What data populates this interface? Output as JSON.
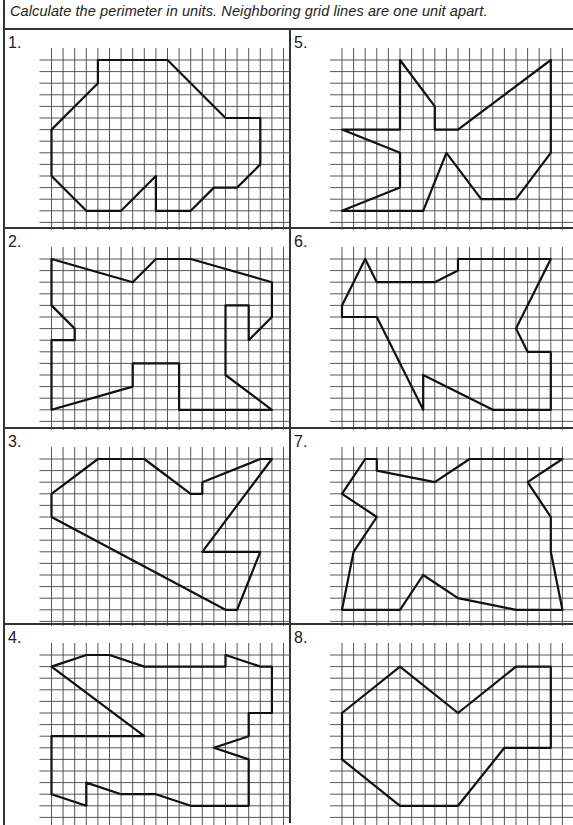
{
  "instructions": "Calculate the perimeter in units. Neighboring grid lines are one unit apart.",
  "grid": {
    "columns": 20,
    "rows": 14,
    "unit_px": 11.6,
    "line_color": "#444444",
    "shape_color": "#111111"
  },
  "problems": [
    {
      "number": "1.",
      "vertices": [
        [
          4,
          0
        ],
        [
          10,
          0
        ],
        [
          15,
          5
        ],
        [
          18,
          5
        ],
        [
          18,
          9
        ],
        [
          16,
          11
        ],
        [
          14,
          11
        ],
        [
          12,
          13
        ],
        [
          9,
          13
        ],
        [
          9,
          10
        ],
        [
          6,
          13
        ],
        [
          3,
          13
        ],
        [
          0,
          10
        ],
        [
          0,
          6
        ],
        [
          4,
          2
        ]
      ]
    },
    {
      "number": "2.",
      "vertices": [
        [
          0,
          0
        ],
        [
          7,
          2
        ],
        [
          9,
          0
        ],
        [
          12,
          0
        ],
        [
          19,
          2
        ],
        [
          19,
          5
        ],
        [
          17,
          7
        ],
        [
          17,
          4
        ],
        [
          15,
          4
        ],
        [
          15,
          10
        ],
        [
          19,
          13
        ],
        [
          11,
          13
        ],
        [
          11,
          9
        ],
        [
          7,
          9
        ],
        [
          7,
          11
        ],
        [
          0,
          13
        ],
        [
          0,
          7
        ],
        [
          2,
          7
        ],
        [
          2,
          6
        ],
        [
          0,
          4
        ]
      ]
    },
    {
      "number": "3.",
      "vertices": [
        [
          4,
          0
        ],
        [
          8,
          0
        ],
        [
          12,
          3
        ],
        [
          13,
          3
        ],
        [
          13,
          2
        ],
        [
          18,
          0
        ],
        [
          19,
          0
        ],
        [
          13,
          8
        ],
        [
          18,
          8
        ],
        [
          16,
          13
        ],
        [
          15,
          13
        ],
        [
          0,
          5
        ],
        [
          0,
          3
        ]
      ]
    },
    {
      "number": "4.",
      "vertices": [
        [
          0,
          1
        ],
        [
          3,
          0
        ],
        [
          5,
          0
        ],
        [
          8,
          1
        ],
        [
          15,
          1
        ],
        [
          15,
          0
        ],
        [
          18,
          1
        ],
        [
          19,
          1
        ],
        [
          19,
          5
        ],
        [
          17,
          5
        ],
        [
          17,
          7
        ],
        [
          14,
          8
        ],
        [
          17,
          9
        ],
        [
          17,
          13
        ],
        [
          12,
          13
        ],
        [
          9,
          12
        ],
        [
          6,
          12
        ],
        [
          3,
          11
        ],
        [
          3,
          13
        ],
        [
          0,
          12
        ],
        [
          0,
          7
        ],
        [
          8,
          7
        ]
      ]
    },
    {
      "number": "5.",
      "vertices": [
        [
          5,
          0
        ],
        [
          8,
          4
        ],
        [
          8,
          6
        ],
        [
          10,
          6
        ],
        [
          18,
          0
        ],
        [
          18,
          8
        ],
        [
          15,
          12
        ],
        [
          12,
          12
        ],
        [
          9,
          8
        ],
        [
          7,
          13
        ],
        [
          0,
          13
        ],
        [
          5,
          11
        ],
        [
          5,
          8
        ],
        [
          0,
          6
        ],
        [
          5,
          6
        ]
      ]
    },
    {
      "number": "6.",
      "vertices": [
        [
          2,
          0
        ],
        [
          3,
          2
        ],
        [
          8,
          2
        ],
        [
          10,
          1
        ],
        [
          10,
          0
        ],
        [
          18,
          0
        ],
        [
          15,
          6
        ],
        [
          16,
          8
        ],
        [
          18,
          8
        ],
        [
          18,
          13
        ],
        [
          13,
          13
        ],
        [
          7,
          10
        ],
        [
          7,
          13
        ],
        [
          3,
          5
        ],
        [
          0,
          5
        ],
        [
          0,
          4
        ]
      ]
    },
    {
      "number": "7.",
      "vertices": [
        [
          2,
          0
        ],
        [
          3,
          0
        ],
        [
          3,
          1
        ],
        [
          8,
          2
        ],
        [
          11,
          0
        ],
        [
          19,
          0
        ],
        [
          16,
          2
        ],
        [
          18,
          5
        ],
        [
          18,
          8
        ],
        [
          19,
          13
        ],
        [
          15,
          13
        ],
        [
          10,
          12
        ],
        [
          7,
          10
        ],
        [
          5,
          13
        ],
        [
          0,
          13
        ],
        [
          1,
          8
        ],
        [
          3,
          5
        ],
        [
          0,
          3
        ]
      ]
    },
    {
      "number": "8.",
      "vertices": [
        [
          5,
          1
        ],
        [
          10,
          5
        ],
        [
          15,
          1
        ],
        [
          18,
          1
        ],
        [
          18,
          8
        ],
        [
          14,
          8
        ],
        [
          10,
          13
        ],
        [
          5,
          13
        ],
        [
          0,
          9
        ],
        [
          0,
          5
        ]
      ]
    }
  ]
}
